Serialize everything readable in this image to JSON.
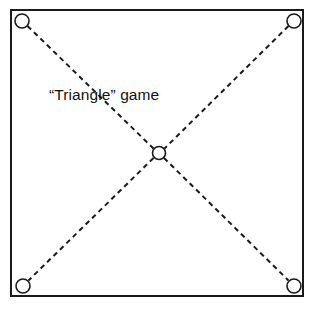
{
  "figure": {
    "title": "“Triangle” game",
    "caption_text": "“Triangle” game",
    "background_color": "#ffffff",
    "stroke_color": "#1a1a1a",
    "text_color": "#111111",
    "board": {
      "name": "square-board",
      "left": 10,
      "top": 9,
      "right": 303,
      "bottom": 296,
      "border_width": 2,
      "fill": "#ffffff"
    },
    "nodes": [
      {
        "id": "top-left",
        "label": "top-left-node",
        "cx": 22,
        "cy": 21,
        "r": 7
      },
      {
        "id": "top-right",
        "label": "top-right-node",
        "cx": 294,
        "cy": 21,
        "r": 7
      },
      {
        "id": "bottom-left",
        "label": "bottom-left-node",
        "cx": 23,
        "cy": 286,
        "r": 7
      },
      {
        "id": "bottom-right",
        "label": "bottom-right-node",
        "cx": 294,
        "cy": 286,
        "r": 7
      },
      {
        "id": "center",
        "label": "center-node",
        "cx": 159,
        "cy": 153,
        "r": 6.5
      }
    ],
    "edges": [
      {
        "id": "diagonal-tl-br",
        "from": "top-left",
        "to": "bottom-right",
        "style": "dashed"
      },
      {
        "id": "diagonal-tr-bl",
        "from": "top-right",
        "to": "bottom-left",
        "style": "dashed"
      }
    ],
    "dash": {
      "dash_length": 5,
      "gap_length": 4,
      "stroke_width": 2
    }
  }
}
